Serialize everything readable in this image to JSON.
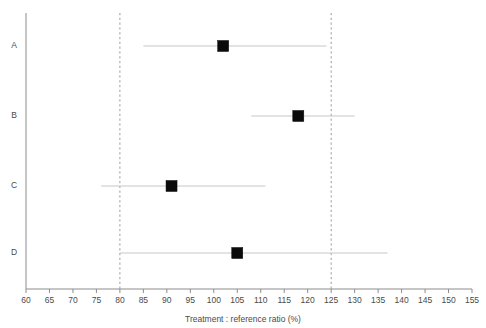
{
  "chart_data": {
    "type": "scatter",
    "subtype": "forest-plot",
    "title": "",
    "xlabel": "Treatment : reference ratio (%)",
    "ylabel": "",
    "xlim": [
      60,
      155
    ],
    "ylim": [
      0,
      5
    ],
    "xticks": [
      60,
      65,
      70,
      75,
      80,
      85,
      90,
      95,
      100,
      105,
      110,
      115,
      120,
      125,
      130,
      135,
      140,
      145,
      150,
      155
    ],
    "xtick_labels": [
      "60",
      "65",
      "70",
      "75",
      "80",
      "85",
      "90",
      "95",
      "100",
      "105",
      "110",
      "115",
      "120",
      "125",
      "130",
      "135",
      "140",
      "145",
      "150",
      "155"
    ],
    "categories": [
      "A",
      "B",
      "C",
      "D"
    ],
    "grid": false,
    "legend": null,
    "reference_lines": [
      {
        "name": "lower-bioequivalence-limit",
        "value": 80,
        "style": "dashed"
      },
      {
        "name": "upper-bioequivalence-limit",
        "value": 125,
        "style": "dashed"
      }
    ],
    "points": [
      {
        "category": "A",
        "estimate": 102,
        "ci_low": 85,
        "ci_high": 124
      },
      {
        "category": "B",
        "estimate": 118,
        "ci_low": 108,
        "ci_high": 130
      },
      {
        "category": "C",
        "estimate": 91,
        "ci_low": 76,
        "ci_high": 111
      },
      {
        "category": "D",
        "estimate": 105,
        "ci_low": 80,
        "ci_high": 137
      }
    ],
    "marker": {
      "shape": "square",
      "color": "#0b0b0b",
      "size": 11
    },
    "ci_color": "#c8c8c8",
    "axis_color": "#8c8c8c",
    "reference_line_color": "#9b9b9b",
    "background_color": "#ffffff"
  }
}
